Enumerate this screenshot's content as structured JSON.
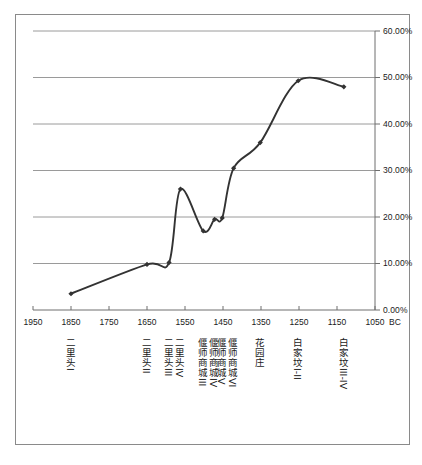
{
  "chart_data": {
    "type": "line",
    "title": "",
    "xlabel": "BC",
    "ylabel": "",
    "xlim": [
      1950,
      1050
    ],
    "x_reversed": true,
    "ylim": [
      0.0,
      60.0
    ],
    "y_unit": "%",
    "grid": true,
    "legend": "none",
    "y_ticks": [
      "0.00%",
      "10.00%",
      "20.00%",
      "30.00%",
      "40.00%",
      "50.00%",
      "60.00%"
    ],
    "y_tick_values": [
      0,
      10,
      20,
      30,
      40,
      50,
      60
    ],
    "x_ticks": [
      "1950",
      "1850",
      "1750",
      "1650",
      "1550",
      "1450",
      "1350",
      "1250",
      "1150",
      "1050"
    ],
    "x_tick_values": [
      1950,
      1850,
      1750,
      1650,
      1550,
      1450,
      1350,
      1250,
      1150,
      1050
    ],
    "x_unit_label": "BC",
    "series": [
      {
        "name": "",
        "marker": "diamond",
        "color": "#333333",
        "smoothed": true,
        "points": [
          {
            "x": 1850,
            "y": 3.5,
            "phase": "二里头I"
          },
          {
            "x": 1650,
            "y": 9.8,
            "phase": "二里头II"
          },
          {
            "x": 1592,
            "y": 10.2,
            "phase": "二里头III"
          },
          {
            "x": 1562,
            "y": 26.0,
            "phase": "二里头IV"
          },
          {
            "x": 1502,
            "y": 17.0,
            "phase": "偃师商城III"
          },
          {
            "x": 1472,
            "y": 19.5,
            "phase": "偃师商城IV"
          },
          {
            "x": 1452,
            "y": 19.8,
            "phase": "偃师商城V"
          },
          {
            "x": 1422,
            "y": 30.5,
            "phase": "偃师商城VI"
          },
          {
            "x": 1352,
            "y": 36.0,
            "phase": "花园庄"
          },
          {
            "x": 1252,
            "y": 49.3,
            "phase": "白家坟I-II"
          },
          {
            "x": 1132,
            "y": 48.0,
            "phase": "白家坟III-IV"
          }
        ]
      }
    ],
    "category_labels": [
      {
        "text": "二里头I",
        "x": 1850
      },
      {
        "text": "二里头II",
        "x": 1650
      },
      {
        "text": "二里头III",
        "x": 1592
      },
      {
        "text": "二里头IV",
        "x": 1562
      },
      {
        "text": "偃师商城III",
        "x": 1502
      },
      {
        "text": "偃师商城IV",
        "x": 1472
      },
      {
        "text": "偃师商城V",
        "x": 1452
      },
      {
        "text": "偃师商城VI",
        "x": 1422
      },
      {
        "text": "花园庄",
        "x": 1352
      },
      {
        "text": "白家坟I-II",
        "x": 1252
      },
      {
        "text": "白家坟III-IV",
        "x": 1132
      }
    ],
    "colors": {
      "line": "#333333",
      "grid": "#9a9a9a",
      "axis": "#6e6e6e",
      "border": "#8a8a8a",
      "text": "#1a1a1a",
      "background": "#ffffff"
    }
  }
}
